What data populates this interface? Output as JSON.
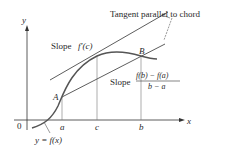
{
  "figure": {
    "annotation": "Tangent parallel to chord",
    "tangent_label_prefix": "Slope",
    "tangent_label_math": "f′(c)",
    "chord_label_prefix": "Slope",
    "chord_numerator": "f(b) − f(a)",
    "chord_denominator": "b − a",
    "point_a_label": "A",
    "point_b_label": "B",
    "curve_label": "y = f(x)",
    "axes": {
      "x_label": "x",
      "y_label": "y",
      "origin_label": "0",
      "ticks": [
        "a",
        "c",
        "b"
      ]
    },
    "colors": {
      "curve": "#555555",
      "lines": "#333333",
      "text": "#2a2a2a"
    }
  }
}
